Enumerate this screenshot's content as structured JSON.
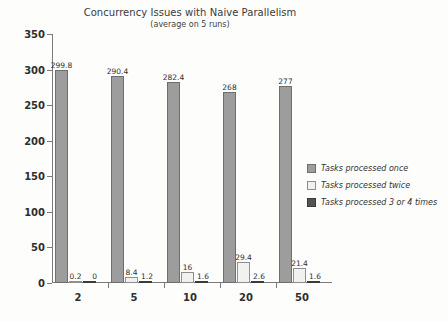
{
  "chart_data": {
    "type": "bar",
    "title": "Concurrency Issues with Naive Parallelism",
    "subtitle": "(average on 5 runs)",
    "xlabel": "",
    "ylabel": "",
    "ylim": [
      0,
      350
    ],
    "ytick_step": 50,
    "yticks": [
      "0",
      "50",
      "100",
      "150",
      "200",
      "250",
      "300",
      "350"
    ],
    "grid": false,
    "legend_position": "right",
    "categories": [
      "2",
      "5",
      "10",
      "20",
      "50"
    ],
    "series": [
      {
        "name": "Tasks processed once",
        "color": "#9d9d9d",
        "values": [
          299.8,
          290.4,
          282.4,
          268,
          277
        ],
        "labels": [
          "299.8",
          "290.4",
          "282.4",
          "268",
          "277"
        ]
      },
      {
        "name": "Tasks processed twice",
        "color": "#f1f1ef",
        "values": [
          0.2,
          8.4,
          16,
          29.4,
          21.4
        ],
        "labels": [
          "0.2",
          "8.4",
          "16",
          "29.4",
          "21.4"
        ]
      },
      {
        "name": "Tasks processed 3 or 4 times",
        "color": "#545454",
        "values": [
          0,
          1.2,
          1.6,
          2.6,
          1.6
        ],
        "labels": [
          "0",
          "1.2",
          "1.6",
          "2.6",
          "1.6"
        ]
      }
    ]
  }
}
